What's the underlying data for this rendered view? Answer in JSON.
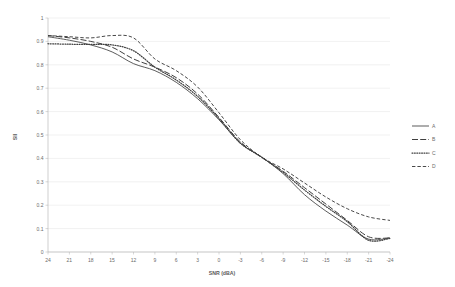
{
  "chart_data": {
    "type": "line",
    "title": "",
    "xlabel": "SNR (dBA)",
    "ylabel": "SII",
    "xlim": [
      24,
      -24
    ],
    "ylim": [
      0,
      1
    ],
    "x_reversed": true,
    "grid": true,
    "legend_position": "right",
    "x_tick_labels": [
      "24",
      "21",
      "18",
      "15",
      "12",
      "9",
      "6",
      "3",
      "0",
      "-3",
      "-6",
      "-9",
      "-12",
      "-15",
      "-18",
      "-21",
      "-24"
    ],
    "y_tick_labels": [
      "0",
      "0.1",
      "0.2",
      "0.3",
      "0.4",
      "0.5",
      "0.6",
      "0.7",
      "0.8",
      "0.9",
      "1"
    ],
    "x": [
      24,
      21,
      18,
      15,
      12,
      9,
      6,
      3,
      0,
      -3,
      -6,
      -9,
      -12,
      -15,
      -18,
      -21,
      -24
    ],
    "series": [
      {
        "name": "A",
        "style": "solid",
        "color": "#3f3f3f",
        "values": [
          0.92,
          0.905,
          0.885,
          0.855,
          0.805,
          0.775,
          0.725,
          0.655,
          0.565,
          0.465,
          0.405,
          0.335,
          0.245,
          0.175,
          0.115,
          0.055,
          0.06
        ]
      },
      {
        "name": "B",
        "style": "long-dash",
        "color": "#3f3f3f",
        "values": [
          0.925,
          0.915,
          0.9,
          0.875,
          0.825,
          0.79,
          0.745,
          0.675,
          0.575,
          0.47,
          0.405,
          0.345,
          0.275,
          0.205,
          0.135,
          0.065,
          0.06
        ]
      },
      {
        "name": "C",
        "style": "dotted",
        "color": "#3f3f3f",
        "values": [
          0.89,
          0.888,
          0.887,
          0.885,
          0.86,
          0.79,
          0.735,
          0.665,
          0.57,
          0.465,
          0.405,
          0.34,
          0.265,
          0.195,
          0.13,
          0.05,
          0.058
        ]
      },
      {
        "name": "D",
        "style": "dashed",
        "color": "#3f3f3f",
        "values": [
          0.925,
          0.92,
          0.915,
          0.925,
          0.915,
          0.825,
          0.775,
          0.705,
          0.595,
          0.48,
          0.405,
          0.355,
          0.295,
          0.235,
          0.185,
          0.15,
          0.135
        ]
      }
    ],
    "legend_entries": [
      {
        "label": "A",
        "style": "solid"
      },
      {
        "label": "B",
        "style": "long-dash"
      },
      {
        "label": "C",
        "style": "dotted"
      },
      {
        "label": "D",
        "style": "dashed"
      }
    ]
  }
}
